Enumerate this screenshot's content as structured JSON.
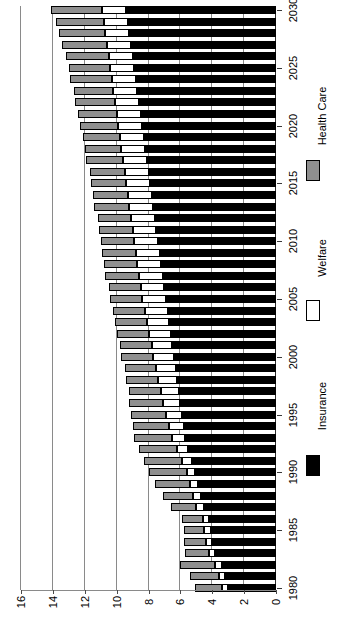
{
  "chart_data": {
    "type": "bar",
    "orientation": "rotated-horizontal-stacked",
    "title": "",
    "subtitle": "",
    "xlabel": "",
    "ylabel": "",
    "stacked": true,
    "grid": true,
    "legend_position": "right",
    "value_axis": {
      "min": 0,
      "max": 16,
      "tick_step": 2,
      "tick_labels": [
        "0",
        "2",
        "4",
        "6",
        "8",
        "10",
        "12",
        "14",
        "16"
      ],
      "tick_values": [
        0,
        2,
        4,
        6,
        8,
        10,
        12,
        14,
        16
      ]
    },
    "category_axis": {
      "label": "",
      "tick_labels": [
        "1980",
        "1985",
        "1990",
        "1995",
        "2000",
        "2005",
        "2010",
        "2015",
        "2020",
        "2025",
        "2030"
      ],
      "tick_values": [
        1980,
        1985,
        1990,
        1995,
        2000,
        2005,
        2010,
        2015,
        2020,
        2025,
        2030
      ]
    },
    "categories": [
      1980,
      1981,
      1982,
      1983,
      1984,
      1985,
      1986,
      1987,
      1988,
      1989,
      1990,
      1991,
      1992,
      1993,
      1994,
      1995,
      1996,
      1997,
      1998,
      1999,
      2000,
      2001,
      2002,
      2003,
      2004,
      2005,
      2006,
      2007,
      2008,
      2009,
      2010,
      2011,
      2012,
      2013,
      2014,
      2015,
      2016,
      2017,
      2018,
      2019,
      2020,
      2021,
      2022,
      2023,
      2024,
      2025,
      2026,
      2027,
      2028,
      2029,
      2030
    ],
    "series": [
      {
        "name": "Insurance",
        "color": "#000000",
        "values": [
          3.0,
          3.2,
          3.4,
          3.8,
          4.0,
          4.1,
          4.2,
          4.5,
          4.7,
          4.9,
          5.1,
          5.3,
          5.5,
          5.7,
          5.8,
          5.9,
          6.0,
          6.1,
          6.2,
          6.3,
          6.4,
          6.5,
          6.6,
          6.7,
          6.8,
          6.9,
          7.0,
          7.1,
          7.2,
          7.3,
          7.4,
          7.5,
          7.6,
          7.7,
          7.8,
          7.9,
          8.0,
          8.1,
          8.2,
          8.3,
          8.4,
          8.5,
          8.6,
          8.7,
          8.8,
          8.9,
          9.0,
          9.1,
          9.2,
          9.3,
          9.4
        ]
      },
      {
        "name": "Welfare",
        "color": "#ffffff",
        "values": [
          0.4,
          0.4,
          0.4,
          0.4,
          0.4,
          0.4,
          0.4,
          0.5,
          0.5,
          0.5,
          0.5,
          0.6,
          0.7,
          0.8,
          0.9,
          1.0,
          1.1,
          1.1,
          1.2,
          1.2,
          1.3,
          1.3,
          1.4,
          1.4,
          1.4,
          1.5,
          1.5,
          1.5,
          1.5,
          1.5,
          1.5,
          1.5,
          1.5,
          1.5,
          1.5,
          1.5,
          1.5,
          1.5,
          1.5,
          1.5,
          1.5,
          1.5,
          1.5,
          1.5,
          1.5,
          1.5,
          1.5,
          1.5,
          1.5,
          1.5,
          1.5
        ]
      },
      {
        "name": "Health Care",
        "color": "#8f8f8f",
        "values": [
          1.7,
          1.8,
          2.2,
          1.5,
          1.4,
          1.3,
          1.3,
          1.6,
          1.9,
          2.2,
          2.4,
          2.4,
          2.4,
          2.4,
          2.3,
          2.2,
          2.1,
          2.0,
          2.0,
          2.0,
          2.0,
          2.0,
          2.0,
          2.0,
          2.0,
          2.0,
          2.0,
          2.1,
          2.1,
          2.1,
          2.1,
          2.1,
          2.1,
          2.2,
          2.2,
          2.2,
          2.2,
          2.3,
          2.3,
          2.3,
          2.4,
          2.4,
          2.5,
          2.5,
          2.6,
          2.6,
          2.7,
          2.8,
          2.9,
          3.0,
          3.2
        ]
      }
    ],
    "totals": [
      5.1,
      5.4,
      6.0,
      5.7,
      5.8,
      5.8,
      5.9,
      6.6,
      7.1,
      7.6,
      8.0,
      8.3,
      8.6,
      8.9,
      9.0,
      9.1,
      9.2,
      9.2,
      9.4,
      9.5,
      9.7,
      9.8,
      10.0,
      10.1,
      10.2,
      10.4,
      10.5,
      10.7,
      10.8,
      10.9,
      11.0,
      11.1,
      11.2,
      11.4,
      11.5,
      11.6,
      11.7,
      11.9,
      12.0,
      12.1,
      12.3,
      12.4,
      12.6,
      12.7,
      12.9,
      13.0,
      13.2,
      13.4,
      13.6,
      13.8,
      14.1
    ]
  },
  "legend": {
    "items": [
      {
        "label": "Insurance",
        "color": "#000000"
      },
      {
        "label": "Welfare",
        "color": "#ffffff"
      },
      {
        "label": "Health Care",
        "color": "#8f8f8f"
      }
    ]
  }
}
